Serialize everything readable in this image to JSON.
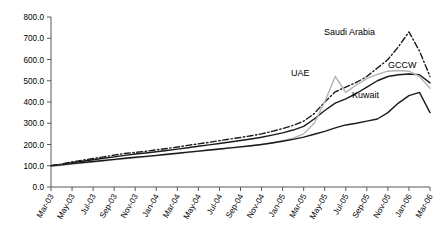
{
  "chart_data": {
    "type": "line",
    "title": "",
    "xlabel": "",
    "ylabel": "",
    "ylim": [
      0,
      800
    ],
    "ytick_step": 100,
    "grid": false,
    "legend_position": "inline-annotations",
    "ytick_labels": [
      "0.0",
      "100.0",
      "200.0",
      "300.0",
      "400.0",
      "500.0",
      "600.0",
      "700.0",
      "800.0"
    ],
    "xtick_labels": [
      "Mar-03",
      "May-03",
      "Jul-03",
      "Sep-03",
      "Nov-03",
      "Jan-04",
      "Mar-04",
      "May-04",
      "Jul-04",
      "Sep-04",
      "Nov-04",
      "Jan-05",
      "Mar-05",
      "May-05",
      "Jul-05",
      "Sep-05",
      "Nov-05",
      "Jan-06",
      "Mar-06"
    ],
    "x": [
      "Mar-03",
      "Apr-03",
      "May-03",
      "Jun-03",
      "Jul-03",
      "Aug-03",
      "Sep-03",
      "Oct-03",
      "Nov-03",
      "Dec-03",
      "Jan-04",
      "Feb-04",
      "Mar-04",
      "Apr-04",
      "May-04",
      "Jun-04",
      "Jul-04",
      "Aug-04",
      "Sep-04",
      "Oct-04",
      "Nov-04",
      "Dec-04",
      "Jan-05",
      "Feb-05",
      "Mar-05",
      "Apr-05",
      "May-05",
      "Jun-05",
      "Jul-05",
      "Aug-05",
      "Sep-05",
      "Oct-05",
      "Nov-05",
      "Dec-05",
      "Jan-06",
      "Feb-06",
      "Mar-06"
    ],
    "series": [
      {
        "name": "Saudi Arabia",
        "color": "#1a1a1a",
        "style": "dash-dot",
        "values": [
          100,
          108,
          118,
          126,
          134,
          142,
          150,
          158,
          163,
          168,
          175,
          181,
          188,
          196,
          203,
          210,
          218,
          226,
          233,
          241,
          250,
          262,
          275,
          290,
          310,
          345,
          400,
          448,
          470,
          492,
          520,
          560,
          600,
          660,
          730,
          640,
          520
        ]
      },
      {
        "name": "GCCW",
        "color": "#1a1a1a",
        "style": "solid",
        "values": [
          100,
          106,
          114,
          121,
          128,
          135,
          142,
          149,
          155,
          160,
          166,
          172,
          178,
          185,
          192,
          198,
          205,
          212,
          219,
          226,
          234,
          244,
          255,
          268,
          285,
          320,
          360,
          395,
          415,
          440,
          470,
          500,
          520,
          528,
          532,
          528,
          490
        ]
      },
      {
        "name": "UAE",
        "color": "#b3b3b3",
        "style": "solid",
        "values": [
          98,
          102,
          108,
          113,
          118,
          123,
          128,
          133,
          138,
          142,
          147,
          152,
          157,
          162,
          168,
          173,
          178,
          183,
          188,
          194,
          200,
          208,
          218,
          230,
          250,
          300,
          400,
          520,
          445,
          480,
          510,
          530,
          545,
          548,
          545,
          520,
          465
        ]
      },
      {
        "name": "Kuwait",
        "color": "#1a1a1a",
        "style": "solid",
        "values": [
          100,
          104,
          110,
          115,
          120,
          125,
          130,
          135,
          140,
          144,
          149,
          154,
          159,
          164,
          169,
          174,
          179,
          184,
          189,
          194,
          200,
          207,
          215,
          224,
          235,
          248,
          262,
          278,
          292,
          300,
          310,
          320,
          350,
          395,
          430,
          445,
          350
        ]
      }
    ],
    "annotations": [
      {
        "text": "Saudi Arabia",
        "x_px": 324,
        "y_px": 35
      },
      {
        "text": "GCCW",
        "x_px": 388,
        "y_px": 68
      },
      {
        "text": "UAE",
        "x_px": 291,
        "y_px": 76
      },
      {
        "text": "Kuwait",
        "x_px": 352,
        "y_px": 98
      }
    ]
  }
}
